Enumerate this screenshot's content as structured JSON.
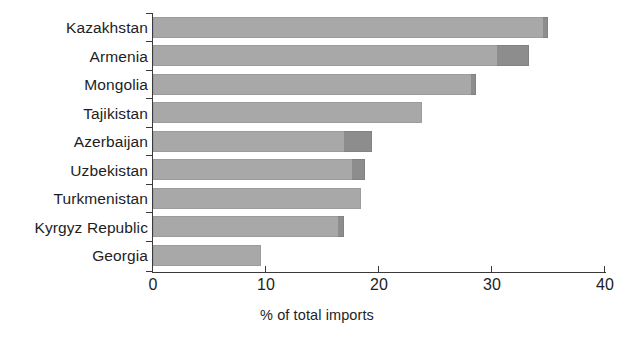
{
  "chart_data": {
    "type": "bar",
    "orientation": "horizontal",
    "stacked": true,
    "title": "",
    "subtitle": "",
    "xlabel": "% of total imports",
    "ylabel": "",
    "xlim": [
      0,
      40
    ],
    "xticks": [
      "0",
      "10",
      "20",
      "30",
      "40"
    ],
    "xtick_values": [
      0,
      10,
      20,
      30,
      40
    ],
    "grid": false,
    "legend": "none",
    "categories": [
      "Kazakhstan",
      "Armenia",
      "Mongolia",
      "Tajikistan",
      "Azerbaijan",
      "Uzbekistan",
      "Turkmenistan",
      "Kyrgyz Republic",
      "Georgia"
    ],
    "series": [
      {
        "name": "segment-1",
        "color": "#a8a8a8",
        "values": [
          34.5,
          30.4,
          28.1,
          23.8,
          16.9,
          17.6,
          18.4,
          16.4,
          9.6
        ]
      },
      {
        "name": "segment-2",
        "color": "#8d8d8d",
        "values": [
          0.5,
          2.9,
          0.5,
          0.0,
          2.5,
          1.2,
          0.0,
          0.5,
          0.0
        ]
      }
    ],
    "totals": [
      35.0,
      33.3,
      28.6,
      23.8,
      19.4,
      18.8,
      18.4,
      16.9,
      9.6
    ]
  },
  "colors": {
    "axis": "#3a3a3a",
    "text": "#221e1f",
    "bar_light": "#a8a8a8",
    "bar_dark": "#8d8d8d",
    "background": "#ffffff"
  }
}
